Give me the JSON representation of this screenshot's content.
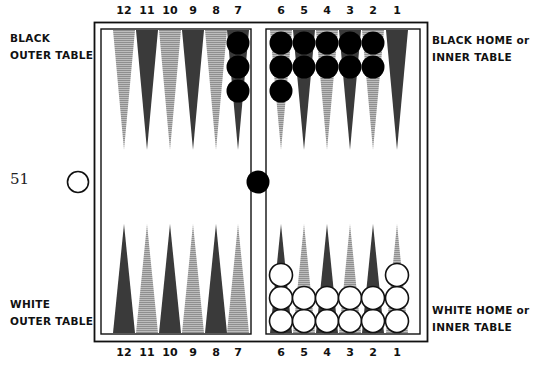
{
  "labels": {
    "black_outer": [
      "BLACK",
      "OUTER TABLE"
    ],
    "black_home": [
      "BLACK HOME or",
      "INNER TABLE"
    ],
    "white_outer": [
      "WHITE",
      "OUTER TABLE"
    ],
    "white_home": [
      "WHITE HOME or",
      "INNER TABLE"
    ]
  },
  "pip_count": "51",
  "top_point_numbers": [
    "12",
    "11",
    "10",
    "9",
    "8",
    "7",
    "6",
    "5",
    "4",
    "3",
    "2",
    "1"
  ],
  "bottom_point_numbers": [
    "12",
    "11",
    "10",
    "9",
    "8",
    "7",
    "6",
    "5",
    "4",
    "3",
    "2",
    "1"
  ],
  "colors": {
    "dark_point": "#3a3a3a",
    "light_point": "#a8a8a8",
    "black_checker": "#000000",
    "white_checker": "#ffffff",
    "frame": "#111111"
  },
  "position": {
    "top_points": [
      {
        "point": 12,
        "black": 0
      },
      {
        "point": 11,
        "black": 0
      },
      {
        "point": 10,
        "black": 0
      },
      {
        "point": 9,
        "black": 0
      },
      {
        "point": 8,
        "black": 0
      },
      {
        "point": 7,
        "black": 3
      },
      {
        "point": 6,
        "black": 3
      },
      {
        "point": 5,
        "black": 2
      },
      {
        "point": 4,
        "black": 2
      },
      {
        "point": 3,
        "black": 2
      },
      {
        "point": 2,
        "black": 2
      },
      {
        "point": 1,
        "black": 0
      }
    ],
    "bottom_points": [
      {
        "point": 12,
        "white": 0
      },
      {
        "point": 11,
        "white": 0
      },
      {
        "point": 10,
        "white": 0
      },
      {
        "point": 9,
        "white": 0
      },
      {
        "point": 8,
        "white": 0
      },
      {
        "point": 7,
        "white": 0
      },
      {
        "point": 6,
        "white": 3
      },
      {
        "point": 5,
        "white": 2
      },
      {
        "point": 4,
        "white": 2
      },
      {
        "point": 3,
        "white": 2
      },
      {
        "point": 2,
        "white": 2
      },
      {
        "point": 1,
        "white": 3
      }
    ],
    "black_on_bar": 1,
    "white_borne_off_marker": 1
  }
}
